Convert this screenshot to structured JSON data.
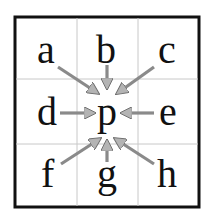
{
  "diagram": {
    "center": "p",
    "neighbors": [
      {
        "label": "a",
        "pos": "top-left"
      },
      {
        "label": "b",
        "pos": "top"
      },
      {
        "label": "c",
        "pos": "top-right"
      },
      {
        "label": "d",
        "pos": "left"
      },
      {
        "label": "e",
        "pos": "right"
      },
      {
        "label": "f",
        "pos": "bottom-left"
      },
      {
        "label": "g",
        "pos": "bottom"
      },
      {
        "label": "h",
        "pos": "bottom-right"
      }
    ],
    "colors": {
      "border": "#111111",
      "grid": "#c8c8c8",
      "arrow_fill": "#b4b4b4",
      "arrow_stroke": "#6e6e6e",
      "text": "#111111"
    }
  }
}
